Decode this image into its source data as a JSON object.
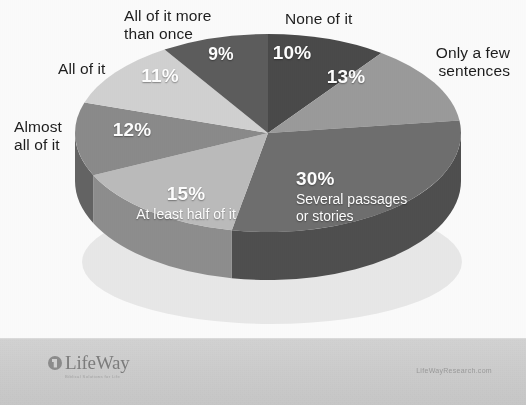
{
  "chart_data": {
    "type": "pie",
    "title": "",
    "subtitle": "",
    "legend_position": "callouts",
    "grid": false,
    "unit": "%",
    "categories": [
      "None of it",
      "Only a few sentences",
      "Several passages or stories",
      "At least half of it",
      "Almost all of it",
      "All of it",
      "All of it more than once"
    ],
    "values": [
      10,
      13,
      30,
      15,
      12,
      11,
      9
    ],
    "labels": [
      "10%",
      "13%",
      "30%",
      "15%",
      "12%",
      "11%",
      "9%"
    ],
    "colors": [
      "#4a4a4a",
      "#9b9b9b",
      "#6f6f6f",
      "#bcbcbc",
      "#8b8b8b",
      "#d2d2d2",
      "#5d5d5d"
    ],
    "side_colors": [
      "#343434",
      "#6f6f6f",
      "#4f4f4f",
      "#8e8e8e",
      "#646464",
      "#a2a2a2",
      "#414141"
    ],
    "slices": [
      {
        "label": "None of it",
        "value": 10,
        "pct_text": "10%",
        "inner_text": "",
        "color": "#4a4a4a"
      },
      {
        "label": "Only a few sentences",
        "value": 13,
        "pct_text": "13%",
        "inner_text": "",
        "color": "#9b9b9b"
      },
      {
        "label": "Several passages or stories",
        "value": 30,
        "pct_text": "30%",
        "inner_text": "Several passages\nor stories",
        "color": "#6f6f6f"
      },
      {
        "label": "At least half of it",
        "value": 15,
        "pct_text": "15%",
        "inner_text": "At least half of it",
        "color": "#bcbcbc"
      },
      {
        "label": "Almost all of it",
        "value": 12,
        "pct_text": "12%",
        "inner_text": "",
        "color": "#8b8b8b"
      },
      {
        "label": "All of it",
        "value": 11,
        "pct_text": "11%",
        "inner_text": "",
        "color": "#d2d2d2"
      },
      {
        "label": "All of it more than once",
        "value": 9,
        "pct_text": "9%",
        "inner_text": "",
        "color": "#5d5d5d"
      }
    ]
  },
  "callouts": {
    "none_of_it": "None of it",
    "only_a_few_sentences": "Only a few\nsentences",
    "all_of_it_more_than_once": "All of it more\nthan once",
    "all_of_it": "All of it",
    "almost_all_of_it": "Almost\nall of it"
  },
  "slice_text": {
    "pct_10": "10%",
    "pct_13": "13%",
    "pct_30": "30%",
    "sub_30": "Several passages\nor stories",
    "pct_15": "15%",
    "sub_15": "At least half of it",
    "pct_12": "12%",
    "pct_11": "11%",
    "pct_9": "9%"
  },
  "footer": {
    "logo_word": "LifeWay",
    "logo_tagline": "Biblical Solutions for Life",
    "site_url": "LifeWayResearch.com"
  }
}
